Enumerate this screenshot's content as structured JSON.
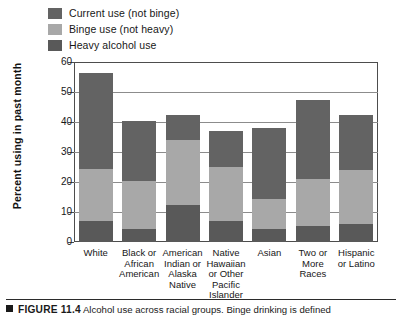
{
  "chart_data": {
    "type": "bar",
    "stacked": true,
    "title": "Alcohol use across racial groups",
    "xlabel": "",
    "ylabel": "Percent using in past month",
    "ylim": [
      0,
      60
    ],
    "yticks": [
      0,
      10,
      20,
      30,
      40,
      50,
      60
    ],
    "grid": true,
    "legend_position": "top-left",
    "categories": [
      "White",
      "Black or African American",
      "American Indian or Alaska Native",
      "Native Hawaiian or Other Pacific Islander",
      "Asian",
      "Two or More Races",
      "Hispanic or Latino"
    ],
    "series": [
      {
        "name": "Heavy alcohol use",
        "color": "#595959",
        "values": [
          7.0,
          4.5,
          12.5,
          7.0,
          4.5,
          5.5,
          6.0
        ]
      },
      {
        "name": "Binge use (not heavy)",
        "color": "#a8a8a8",
        "values": [
          17.5,
          16.0,
          21.5,
          18.0,
          10.0,
          15.5,
          18.0
        ]
      },
      {
        "name": "Current use (not binge)",
        "color": "#636363",
        "values": [
          32.0,
          20.0,
          8.5,
          12.0,
          23.5,
          26.5,
          18.5
        ]
      }
    ],
    "totals": [
      56.5,
      40.5,
      42.5,
      37.0,
      38.0,
      47.5,
      42.5
    ],
    "segment_tops": {
      "heavy": [
        7.0,
        4.5,
        12.5,
        7.0,
        4.5,
        5.5,
        6.0
      ],
      "binge": [
        24.5,
        20.5,
        34.0,
        25.0,
        14.5,
        21.0,
        24.0
      ],
      "current": [
        56.5,
        40.5,
        42.5,
        37.0,
        38.0,
        47.5,
        42.5
      ]
    }
  },
  "legend": {
    "items": [
      {
        "label": "Current use (not binge)",
        "color": "#636363"
      },
      {
        "label": "Binge use (not heavy)",
        "color": "#a8a8a8"
      },
      {
        "label": "Heavy alcohol use",
        "color": "#595959"
      }
    ]
  },
  "axis": {
    "ylabel": "Percent using in past month",
    "yticks": [
      "60",
      "50",
      "40",
      "30",
      "20",
      "10",
      "0"
    ]
  },
  "xaxis": {
    "labels": [
      [
        "White"
      ],
      [
        "Black or",
        "African",
        "American"
      ],
      [
        "American",
        "Indian or",
        "Alaska",
        "Native"
      ],
      [
        "Native",
        "Hawaiian",
        "or Other",
        "Pacific",
        "Islander"
      ],
      [
        "Asian"
      ],
      [
        "Two or",
        "More",
        "Races"
      ],
      [
        "Hispanic",
        "or Latino"
      ]
    ]
  },
  "caption": {
    "figure_number": "FIGURE 11.4",
    "text": "Alcohol use across racial groups. Binge drinking is defined"
  }
}
